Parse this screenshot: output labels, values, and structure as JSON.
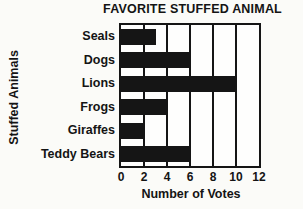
{
  "chart_data": {
    "type": "bar",
    "orientation": "horizontal",
    "title": "FAVORITE STUFFED ANIMAL",
    "categories": [
      "Seals",
      "Dogs",
      "Lions",
      "Frogs",
      "Giraffes",
      "Teddy Bears"
    ],
    "values": [
      3,
      6,
      10,
      4,
      2,
      6
    ],
    "xlabel": "Number of Votes",
    "ylabel": "Stuffed Animals",
    "xlim": [
      0,
      12
    ],
    "xticks": [
      0,
      2,
      4,
      6,
      8,
      10,
      12
    ],
    "grid": true,
    "legend": false,
    "bar_color": "#151515",
    "background": "#fbfbf8"
  }
}
